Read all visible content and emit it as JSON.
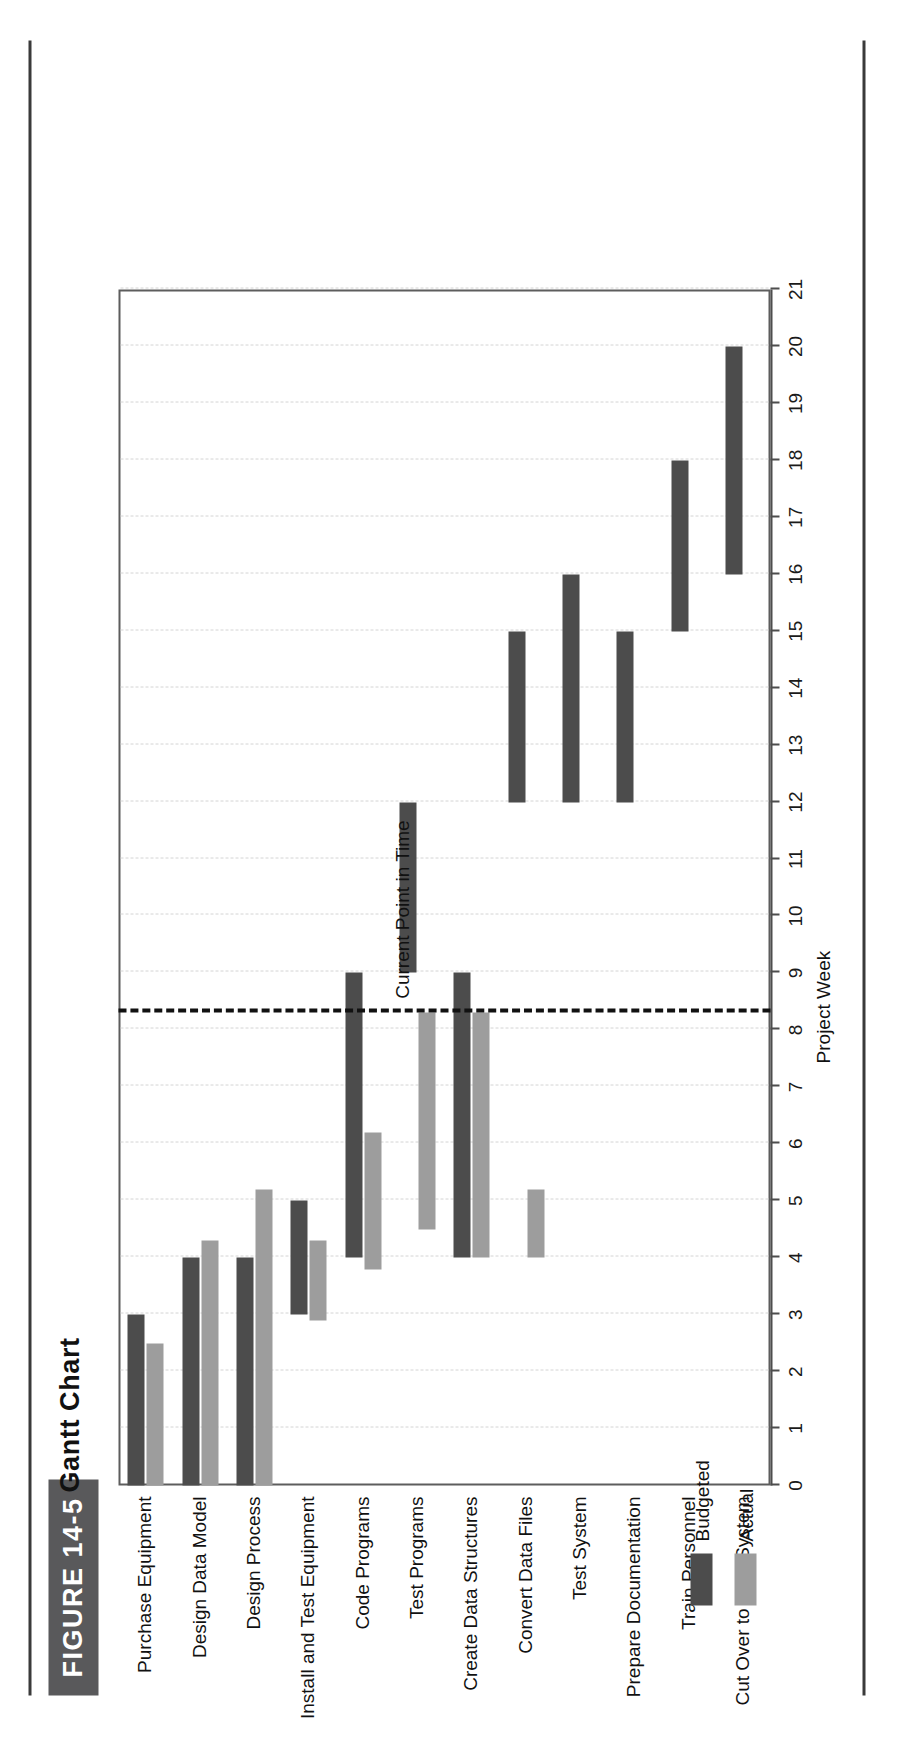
{
  "figure": {
    "tag": "FIGURE 14-5",
    "title": "Gantt Chart"
  },
  "annotation": {
    "current_point_label": "Current Point in Time",
    "current_point_week": 8.3
  },
  "legend": {
    "items": [
      {
        "label": "Budgeted",
        "color": "#4c4c4c"
      },
      {
        "label": "Actual",
        "color": "#9d9d9d"
      }
    ]
  },
  "chart_data": {
    "type": "bar",
    "subtype": "gantt",
    "title": "Gantt Chart",
    "xlabel": "Project Week",
    "ylabel": "",
    "xlim": [
      0,
      21
    ],
    "xticks": [
      0,
      1,
      2,
      3,
      4,
      5,
      6,
      7,
      8,
      9,
      10,
      11,
      12,
      13,
      14,
      15,
      16,
      17,
      18,
      19,
      20,
      21
    ],
    "xticklabels": [
      "0",
      "1",
      "2",
      "3",
      "4",
      "5",
      "6",
      "7",
      "8",
      "9",
      "10",
      "11",
      "12",
      "13",
      "14",
      "15",
      "16",
      "17",
      "18",
      "19",
      "20",
      "21"
    ],
    "grid": true,
    "legend_position": "bottom-left",
    "annotations": [
      {
        "text": "Current Point in Time",
        "x": 8.3,
        "style": "dashed-vertical-line"
      }
    ],
    "categories": [
      "Purchase Equipment",
      "Design Data Model",
      "Design Process",
      "Install and Test Equipment",
      "Code Programs",
      "Test Programs",
      "Create Data Structures",
      "Convert Data Files",
      "Test System",
      "Prepare Documentation",
      "Train Personnel",
      "Cut Over to New System"
    ],
    "series": [
      {
        "name": "Budgeted",
        "color": "#4c4c4c",
        "bars": [
          {
            "task": "Purchase Equipment",
            "start": 0,
            "end": 3
          },
          {
            "task": "Design Data Model",
            "start": 0,
            "end": 4
          },
          {
            "task": "Design Process",
            "start": 0,
            "end": 4
          },
          {
            "task": "Install and Test Equipment",
            "start": 3,
            "end": 5
          },
          {
            "task": "Code Programs",
            "start": 4,
            "end": 9
          },
          {
            "task": "Test Programs",
            "start": 9,
            "end": 12
          },
          {
            "task": "Create Data Structures",
            "start": 4,
            "end": 9
          },
          {
            "task": "Convert Data Files",
            "start": 12,
            "end": 15
          },
          {
            "task": "Test System",
            "start": 12,
            "end": 16
          },
          {
            "task": "Prepare Documentation",
            "start": 12,
            "end": 15
          },
          {
            "task": "Train Personnel",
            "start": 15,
            "end": 18
          },
          {
            "task": "Cut Over to New System",
            "start": 16,
            "end": 20
          }
        ]
      },
      {
        "name": "Actual",
        "color": "#9d9d9d",
        "bars": [
          {
            "task": "Purchase Equipment",
            "start": 0,
            "end": 2.5
          },
          {
            "task": "Design Data Model",
            "start": 0,
            "end": 4.3
          },
          {
            "task": "Design Process",
            "start": 0,
            "end": 5.2
          },
          {
            "task": "Install and Test Equipment",
            "start": 2.9,
            "end": 4.3
          },
          {
            "task": "Code Programs",
            "start": 3.8,
            "end": 6.2
          },
          {
            "task": "Test Programs",
            "start": 4.5,
            "end": 8.3
          },
          {
            "task": "Create Data Structures",
            "start": 4,
            "end": 8.3
          },
          {
            "task": "Convert Data Files",
            "start": 4,
            "end": 5.2
          }
        ]
      }
    ]
  }
}
